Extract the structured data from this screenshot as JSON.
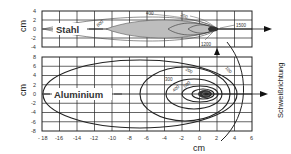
{
  "diagram": {
    "type": "isotherm-comparison",
    "x_axis_label": "cm",
    "y_axis_label_top": "cm",
    "y_axis_label_bottom": "cm",
    "direction_label": "Schweißrichtung",
    "x_ticks": [
      "- 18",
      "-16",
      "-14",
      "-12",
      "-10",
      "-8",
      "-6",
      "-4",
      "-2",
      "0",
      "2",
      "4",
      "6"
    ],
    "top_panel": {
      "material": "Stahl",
      "y_ticks": [
        "4",
        "2",
        "0",
        "-2",
        "-4"
      ],
      "isotherms": [
        "400",
        "200",
        "600",
        "1500",
        "1200"
      ]
    },
    "bottom_panel": {
      "material": "Aluminium",
      "y_ticks": [
        "8",
        "6",
        "4",
        "2",
        "0",
        "-2",
        "-4",
        "-6",
        "-8"
      ],
      "isotherms": [
        "100",
        "200",
        "300",
        "400",
        "500"
      ]
    },
    "colors": {
      "grid": "#222222",
      "fill": "#b8b8b8",
      "core": "#333333",
      "arrow": "#111111"
    }
  }
}
